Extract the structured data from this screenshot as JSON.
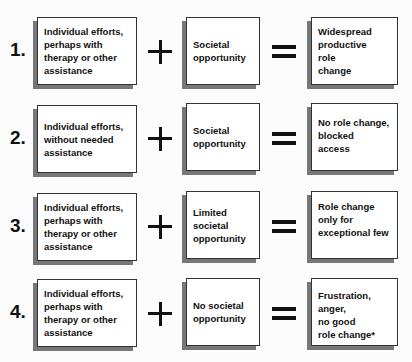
{
  "rows": [
    {
      "number": "1.",
      "individual": "Individual efforts,\nperhaps with\ntherapy or other\nassistance",
      "societal": "Societal\nopportunity",
      "outcome": "Widespread\nproductive\nrole\nchange"
    },
    {
      "number": "2.",
      "individual": "Individual efforts,\nwithout needed\nassistance",
      "societal": "Societal\nopportunity",
      "outcome": "No role change,\nblocked\naccess"
    },
    {
      "number": "3.",
      "individual": "Individual efforts,\nperhaps with\ntherapy or other\nassistance",
      "societal": "Limited\nsocietal\nopportunity",
      "outcome": "Role change\nonly for\nexceptional few"
    },
    {
      "number": "4.",
      "individual": "Individual efforts,\nperhaps with\ntherapy or other\nassistance",
      "societal": "No societal\nopportunity",
      "outcome": "Frustration, anger,\nno good\nrole change*"
    }
  ],
  "operators": {
    "plus": "+",
    "equals": "="
  }
}
